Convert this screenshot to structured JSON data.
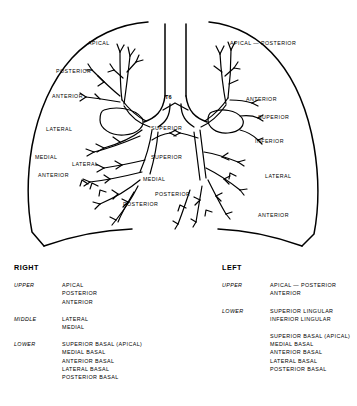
{
  "diagram": {
    "center_marker": "T6",
    "right_lung_labels": [
      {
        "text": "APICAL",
        "x": 88,
        "y": 44
      },
      {
        "text": "POSTERIOR",
        "x": 56,
        "y": 72
      },
      {
        "text": "ANTERIOR",
        "x": 52,
        "y": 97
      },
      {
        "text": "LATERAL",
        "x": 46,
        "y": 130
      },
      {
        "text": "MEDIAL",
        "x": 35,
        "y": 158
      },
      {
        "text": "LATERAL",
        "x": 72,
        "y": 165
      },
      {
        "text": "ANTERIOR",
        "x": 38,
        "y": 176
      },
      {
        "text": "POSTERIOR",
        "x": 123,
        "y": 205
      }
    ],
    "center_labels": [
      {
        "text": "SUPERIOR",
        "x": 151,
        "y": 129
      },
      {
        "text": "SUPERIOR",
        "x": 151,
        "y": 158
      },
      {
        "text": "MEDIAL",
        "x": 143,
        "y": 180
      },
      {
        "text": "POSTERIOR",
        "x": 155,
        "y": 195
      }
    ],
    "left_lung_labels": [
      {
        "text": "APICAL — POSTERIOR",
        "x": 230,
        "y": 44
      },
      {
        "text": "ANTERIOR",
        "x": 246,
        "y": 100
      },
      {
        "text": "SUPERIOR",
        "x": 258,
        "y": 118
      },
      {
        "text": "INFERIOR",
        "x": 255,
        "y": 142
      },
      {
        "text": "LATERAL",
        "x": 265,
        "y": 177
      },
      {
        "text": "ANTERIOR",
        "x": 258,
        "y": 216
      }
    ]
  },
  "legend": {
    "right": {
      "title": "RIGHT",
      "groups": [
        {
          "lobe": "UPPER",
          "segments": [
            "APICAL",
            "POSTERIOR",
            "ANTERIOR"
          ]
        },
        {
          "lobe": "MIDDLE",
          "segments": [
            "LATERAL",
            "MEDIAL"
          ]
        },
        {
          "lobe": "LOWER",
          "segments": [
            "SUPERIOR BASAL (APICAL)",
            "MEDIAL BASAL",
            "ANTERIOR BASAL",
            "LATERAL BASAL",
            "POSTERIOR BASAL"
          ]
        }
      ]
    },
    "left": {
      "title": "LEFT",
      "groups": [
        {
          "lobe": "UPPER",
          "segments": [
            "APICAL — POSTERIOR",
            "ANTERIOR"
          ]
        },
        {
          "lobe": "LOWER",
          "segments": [
            "SUPERIOR LINGULAR",
            "INFERIOR LINGULAR"
          ]
        },
        {
          "lobe": "",
          "segments": [
            "SUPERIOR BASAL (APICAL)",
            "MEDIAL BASAL",
            "ANTERIOR BASAL",
            "LATERAL BASAL",
            "POSTERIOR BASAL"
          ]
        }
      ]
    }
  },
  "colors": {
    "ink": "#000000",
    "background": "#ffffff"
  }
}
